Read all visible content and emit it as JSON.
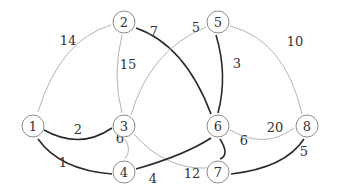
{
  "graph": {
    "type": "weighted-undirected",
    "colors": {
      "light_edge": "#b4b4b4",
      "dark_edge": "#2a2a2a",
      "node_stroke": "#8c8c8c"
    },
    "nodes": [
      {
        "id": "1",
        "label": "1",
        "x": 33,
        "y": 126
      },
      {
        "id": "2",
        "label": "2",
        "x": 124,
        "y": 22
      },
      {
        "id": "3",
        "label": "3",
        "x": 124,
        "y": 126
      },
      {
        "id": "4",
        "label": "4",
        "x": 124,
        "y": 172
      },
      {
        "id": "5",
        "label": "5",
        "x": 218,
        "y": 22
      },
      {
        "id": "6",
        "label": "6",
        "x": 218,
        "y": 126
      },
      {
        "id": "7",
        "label": "7",
        "x": 218,
        "y": 172
      },
      {
        "id": "8",
        "label": "8",
        "x": 307,
        "y": 126
      }
    ],
    "edges": [
      {
        "from": "1",
        "to": "2",
        "weight": "14",
        "highlight": false
      },
      {
        "from": "1",
        "to": "3",
        "weight": "2",
        "highlight": true
      },
      {
        "from": "1",
        "to": "4",
        "weight": "1",
        "highlight": true
      },
      {
        "from": "2",
        "to": "3",
        "weight": "15",
        "highlight": false
      },
      {
        "from": "2",
        "to": "6",
        "weight": "7",
        "highlight": true
      },
      {
        "from": "3",
        "to": "5",
        "weight": "5",
        "highlight": false
      },
      {
        "from": "3",
        "to": "4",
        "weight": "6",
        "highlight": false
      },
      {
        "from": "3",
        "to": "7",
        "weight": "12",
        "highlight": false
      },
      {
        "from": "4",
        "to": "6",
        "weight": "4",
        "highlight": true
      },
      {
        "from": "5",
        "to": "6",
        "weight": "3",
        "highlight": true
      },
      {
        "from": "5",
        "to": "8",
        "weight": "10",
        "highlight": false
      },
      {
        "from": "6",
        "to": "7",
        "weight": "6",
        "highlight": true
      },
      {
        "from": "6",
        "to": "8",
        "weight": "20",
        "highlight": false
      },
      {
        "from": "7",
        "to": "8",
        "weight": "5",
        "highlight": true
      }
    ]
  }
}
